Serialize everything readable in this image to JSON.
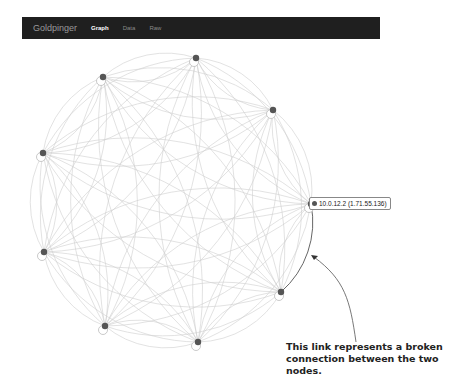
{
  "navbar": {
    "brand": "Goldpinger",
    "tabs": [
      {
        "label": "Graph",
        "active": true
      },
      {
        "label": "Data",
        "active": false
      },
      {
        "label": "Raw",
        "active": false
      }
    ]
  },
  "graph": {
    "nodes": [
      {
        "id": "n0",
        "x": 196,
        "y": 58
      },
      {
        "id": "n1",
        "x": 273,
        "y": 110
      },
      {
        "id": "n2",
        "x": 311,
        "y": 204,
        "label": "10.0.12.2 (1.71.55.136)"
      },
      {
        "id": "n3",
        "x": 281,
        "y": 292
      },
      {
        "id": "n4",
        "x": 198,
        "y": 342
      },
      {
        "id": "n5",
        "x": 105,
        "y": 326
      },
      {
        "id": "n6",
        "x": 44,
        "y": 252
      },
      {
        "id": "n7",
        "x": 43,
        "y": 153
      },
      {
        "id": "n8",
        "x": 103,
        "y": 77
      }
    ],
    "broken_link": {
      "from": "n2",
      "to": "n3"
    },
    "colors": {
      "link": "#cfcfcf",
      "broken_link": "#666666",
      "node_fill": "#555555",
      "node_ring": "#bbbbbb"
    }
  },
  "selected_node_label": "10.0.12.2 (1.71.55.136)",
  "annotation": {
    "line1": "This link represents a broken",
    "line2": "connection between the two nodes."
  }
}
